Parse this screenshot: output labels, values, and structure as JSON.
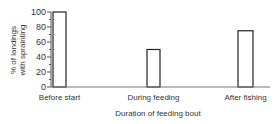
{
  "chart_data": {
    "type": "bar",
    "title": "",
    "categories": [
      "Before start",
      "During feeding",
      "After fishing"
    ],
    "values": [
      100,
      50,
      75
    ],
    "xlabel": "Duration of feeding bout",
    "ylabel_lines": [
      "% of landings",
      "with sprainting"
    ],
    "ylabel": "% of landings with sprainting",
    "ylim": [
      0,
      100
    ],
    "yticks": [
      0,
      20,
      40,
      60,
      80,
      100
    ],
    "yminor_step": 10,
    "grid": false,
    "legend": "none",
    "colors": {
      "bar_fill": "#ffffff",
      "bar_stroke": "#222222",
      "axis": "#555555"
    }
  }
}
